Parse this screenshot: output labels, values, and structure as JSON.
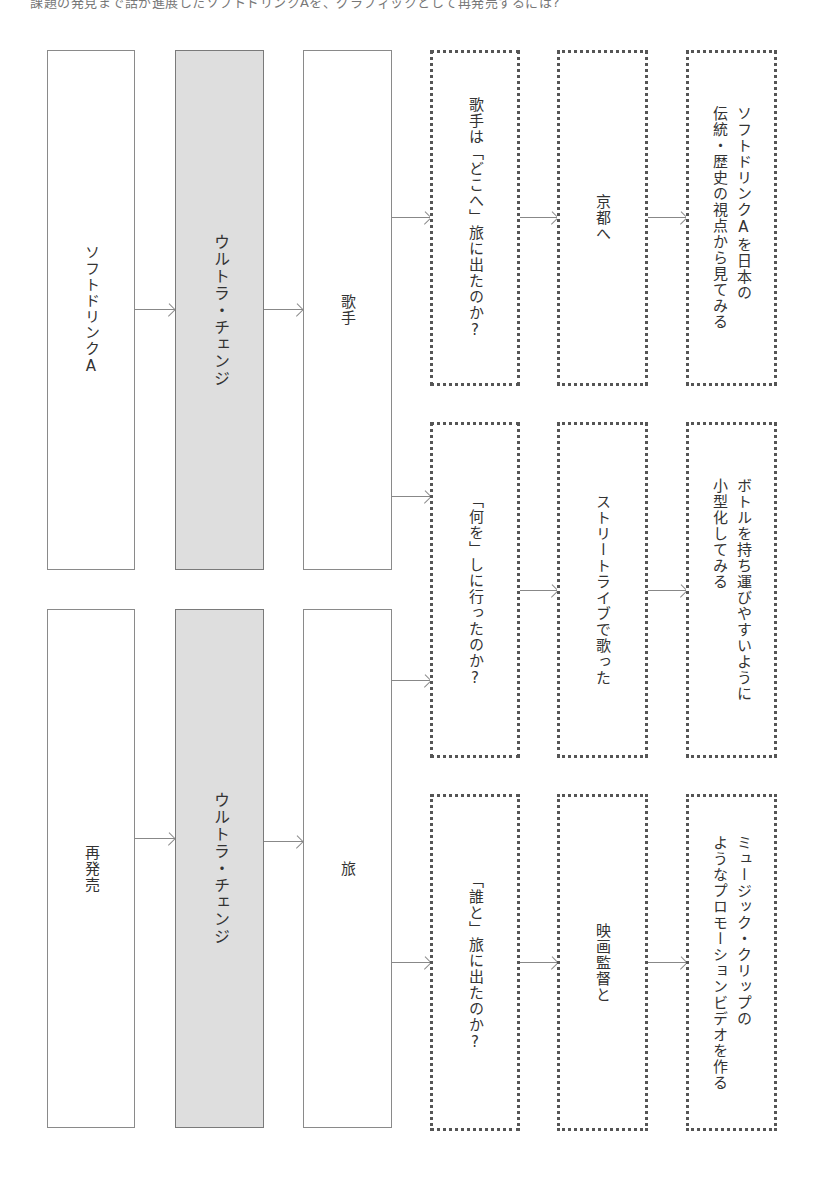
{
  "header": {
    "text": "課題の発見まで話が進展したソフトドリンクAを、グラフィックとして再発売するには?"
  },
  "groups": [
    {
      "source": "ソフトドリンクA",
      "method": "ウルトラ・チェンジ",
      "theme": "歌手"
    },
    {
      "source": "再発売",
      "method": "ウルトラ・チェンジ",
      "theme": "旅"
    }
  ],
  "rows": [
    {
      "question": "歌手は「どこへ」旅に出たのか?",
      "answer": "京都へ",
      "idea": "ソフトドリンクAを日本の\n伝統・歴史の視点から見てみる"
    },
    {
      "question": "「何を」しに行ったのか?",
      "answer": "ストリートライブで歌った",
      "idea": "ボトルを持ち運びやすいように\n小型化してみる"
    },
    {
      "question": "「誰と」旅に出たのか?",
      "answer": "映画監督と",
      "idea": "ミュージック・クリップの\nようなプロモーションビデオを作る"
    }
  ]
}
